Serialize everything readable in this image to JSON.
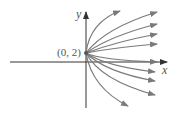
{
  "diagram": {
    "axis_x_label": "x",
    "axis_y_label": "y",
    "point_label": "(0, 2)",
    "colors": {
      "curve": "#7a7a7a",
      "axis": "#333333",
      "text": "#555555"
    },
    "curves_upper": [
      {
        "d": "M86,53 Q90,22 120,11",
        "end": [
          120,
          11
        ]
      },
      {
        "d": "M86,53 Q105,28 157,12",
        "end": [
          157,
          12
        ]
      },
      {
        "d": "M86,53 Q110,36 157,24",
        "end": [
          157,
          24
        ]
      },
      {
        "d": "M86,53 Q115,42 157,34",
        "end": [
          157,
          34
        ]
      },
      {
        "d": "M86,53 Q118,47 157,44",
        "end": [
          157,
          44
        ]
      }
    ],
    "curves_lower": [
      {
        "d": "M86,53 Q100,60 157,62",
        "end": [
          157,
          62
        ]
      },
      {
        "d": "M86,53 Q105,66 155,72",
        "end": [
          155,
          72
        ]
      },
      {
        "d": "M86,53 Q105,72 155,81",
        "end": [
          155,
          81
        ]
      },
      {
        "d": "M86,53 Q100,80 155,95",
        "end": [
          155,
          95
        ]
      },
      {
        "d": "M86,53 Q92,88 128,106",
        "end": [
          128,
          106
        ]
      }
    ]
  }
}
